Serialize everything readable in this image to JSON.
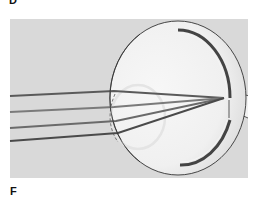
{
  "figure": {
    "type": "anatomical-diagram",
    "panel_labels": {
      "top": "D",
      "bottom": "F"
    },
    "colors": {
      "panel_background": "#d9d9d9",
      "globe_fill": "#f2f2f2",
      "outline": "#333333",
      "ray_dark": "#555555",
      "ray_mid": "#7a7a7a",
      "lens_outline": "#e6e6e6",
      "retina": "#6a6a6a"
    },
    "rays": [
      {
        "name": "ray-1",
        "start_y": 96
      },
      {
        "name": "ray-2",
        "start_y": 112
      },
      {
        "name": "ray-3",
        "start_y": 128
      },
      {
        "name": "ray-4",
        "start_y": 141
      }
    ],
    "focal_point": {
      "x": 225,
      "y": 98
    }
  }
}
